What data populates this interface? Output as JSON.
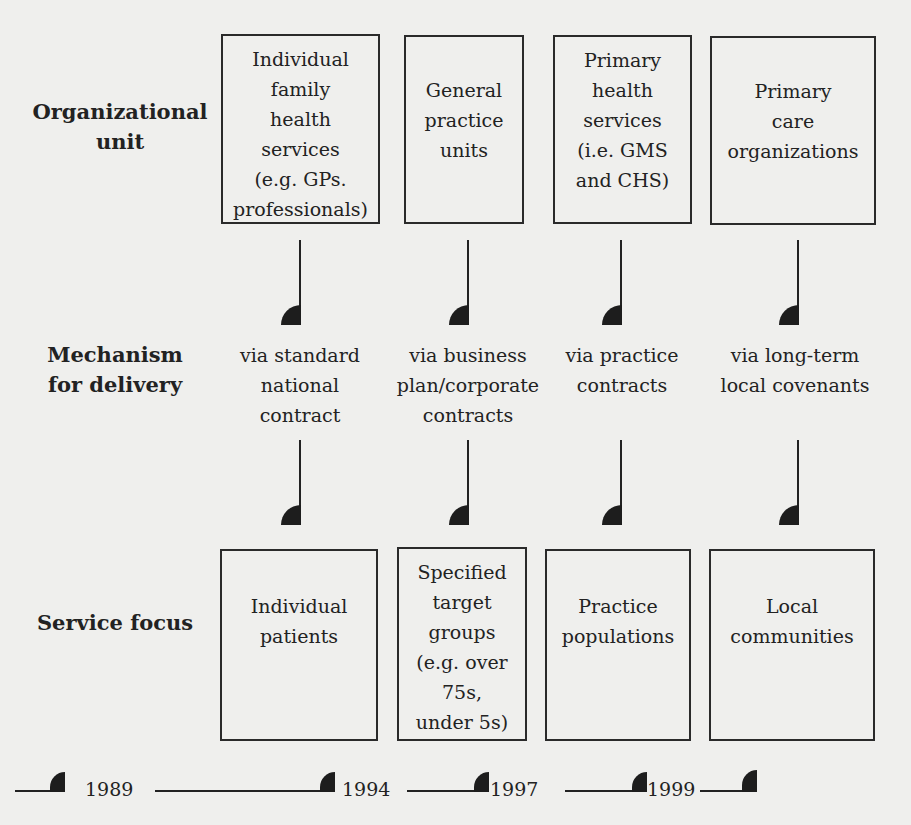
{
  "diagram": {
    "rows": {
      "organizational_unit": "Organizational\nunit",
      "mechanism": "Mechanism\nfor delivery",
      "service_focus": "Service focus"
    },
    "organizational_units": [
      "Individual\nfamily\nhealth\nservices\n(e.g. GPs.\nprofessionals)",
      "General\npractice\nunits",
      "Primary\nhealth\nservices\n(i.e. GMS\nand CHS)",
      "Primary\ncare\norganizations"
    ],
    "mechanisms": [
      "via standard\nnational\ncontract",
      "via business\nplan/corporate\ncontracts",
      "via practice\ncontracts",
      "via long-term\nlocal covenants"
    ],
    "service_focus": [
      "Individual\npatients",
      "Specified\ntarget\ngroups\n(e.g. over\n75s,\nunder 5s)",
      "Practice\npopulations",
      "Local\ncommunities"
    ],
    "timeline": {
      "years": [
        "1989",
        "1994",
        "1997",
        "1999"
      ]
    }
  }
}
